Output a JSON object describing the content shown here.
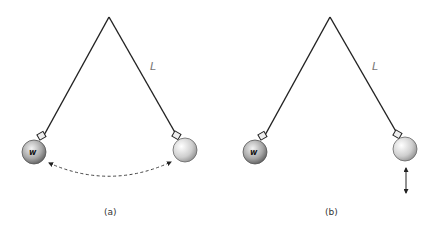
{
  "figure": {
    "panels": [
      {
        "caption": "(a)",
        "string_label": "L",
        "bob_left_label": "w",
        "motion": "swing (dashed double-headed arc between bobs)"
      },
      {
        "caption": "(b)",
        "string_label": "L",
        "bob_left_label": "w",
        "motion": "vertical oscillation (double-headed vertical arrow below right bob)"
      }
    ]
  },
  "colors": {
    "line": "#222222",
    "label_L": "#777777",
    "bob_light": "#f4f4f4",
    "bob_dark": "#7a7a7a"
  }
}
